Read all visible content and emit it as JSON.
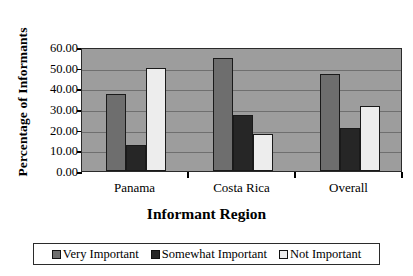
{
  "chart_data": {
    "type": "bar",
    "title": "",
    "xlabel": "Informant Region",
    "ylabel": "Percentage of Informants",
    "categories": [
      "Panama",
      "Costa Rica",
      "Overall"
    ],
    "series": [
      {
        "name": "Very Important",
        "color": "#6e6e6e",
        "values": [
          37.5,
          54.5,
          47.0
        ]
      },
      {
        "name": "Somewhat Important",
        "color": "#262626",
        "values": [
          12.5,
          27.0,
          21.0
        ]
      },
      {
        "name": "Not Important",
        "color": "#ededed",
        "values": [
          50.0,
          18.0,
          31.5
        ]
      }
    ],
    "ylim": [
      0,
      60
    ],
    "ytick_values": [
      0,
      10,
      20,
      30,
      40,
      50,
      60
    ],
    "ytick_labels": [
      "0.00",
      "10.00",
      "20.00",
      "30.00",
      "40.00",
      "50.00",
      "60.00"
    ],
    "grid": true,
    "legend_position": "bottom",
    "plot_background": "#9d9d9d",
    "gridline_color": "#6f6f6f",
    "axis_color": "#2b2b2b"
  },
  "axes": {
    "y_title": "Percentage of Informants",
    "x_title": "Informant Region"
  },
  "legend": {
    "items": [
      {
        "label": "Very Important",
        "color": "#6e6e6e"
      },
      {
        "label": "Somewhat Important",
        "color": "#262626"
      },
      {
        "label": "Not Important",
        "color": "#ededed"
      }
    ]
  }
}
